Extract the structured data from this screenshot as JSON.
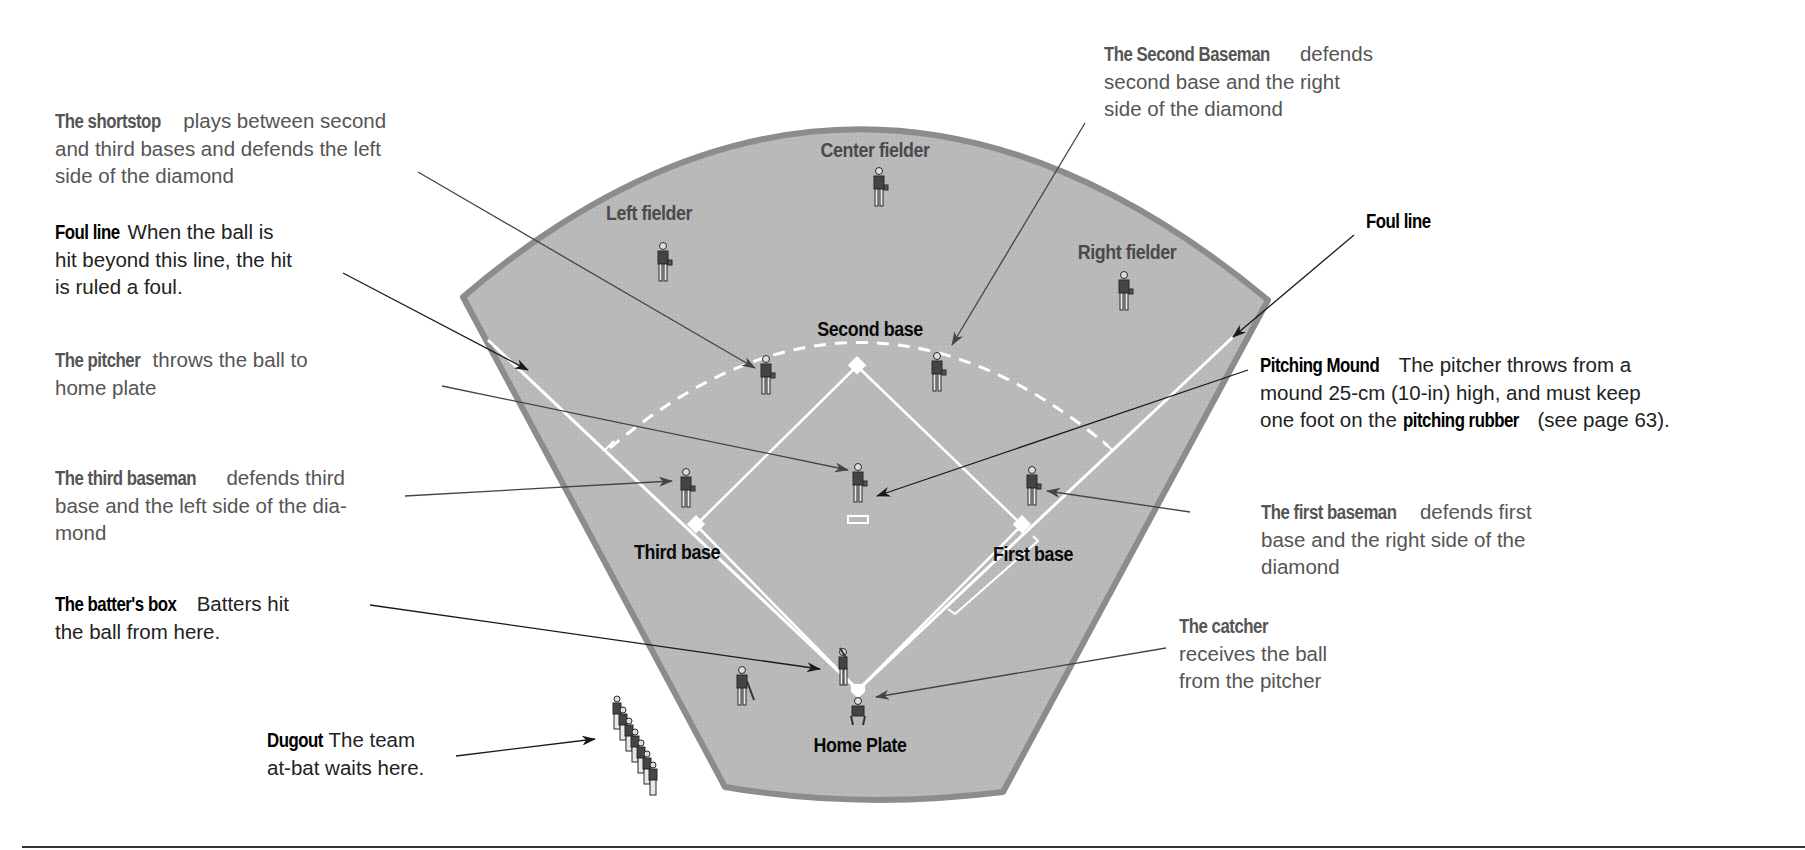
{
  "colors": {
    "field_fill": "#b9b9b9",
    "field_border": "#8c8c8c",
    "chalk": "#ffffff",
    "label_gray": "#555555",
    "label_black": "#111111",
    "leader_line": "#333333"
  },
  "field_labels": {
    "center_fielder": "Center fielder",
    "left_fielder": "Left fielder",
    "right_fielder": "Right fielder",
    "second_base": "Second base",
    "third_base": "Third base",
    "first_base": "First base",
    "home_plate": "Home Plate"
  },
  "callouts": {
    "shortstop": {
      "term": "The shortstop",
      "lines": [
        "plays between second",
        "and third bases and defends the left",
        "side of the diamond"
      ]
    },
    "foul_line_left": {
      "term": "Foul line",
      "lines": [
        "When the ball is",
        "hit beyond this line, the hit",
        "is ruled a foul."
      ]
    },
    "pitcher": {
      "term": "The pitcher",
      "lines": [
        "throws the ball to",
        "home plate"
      ]
    },
    "third_baseman": {
      "term": "The third baseman",
      "lines": [
        "defends third",
        "base and the left side of the dia-",
        "mond"
      ]
    },
    "batters_box": {
      "term": "The batter's box",
      "lines": [
        "Batters hit",
        "the ball from here."
      ]
    },
    "dugout": {
      "term": "Dugout",
      "lines": [
        "The team",
        "at-bat waits here."
      ]
    },
    "second_baseman": {
      "term": "The Second Baseman",
      "lines": [
        "defends",
        "second base and the right",
        "side of the diamond"
      ]
    },
    "foul_line_right": {
      "term": "Foul line"
    },
    "pitching_mound": {
      "term": "Pitching Mound",
      "lines": [
        "The pitcher throws from a",
        "mound 25-cm (10-in) high, and must keep",
        "one foot on the"
      ],
      "inline_term": "pitching rubber",
      "tail": "(see page 63)."
    },
    "first_baseman": {
      "term": "The first baseman",
      "lines": [
        "defends first",
        "base and the right side of the",
        "diamond"
      ]
    },
    "catcher": {
      "term": "The catcher",
      "lines": [
        "receives the ball",
        "from the pitcher"
      ]
    }
  }
}
